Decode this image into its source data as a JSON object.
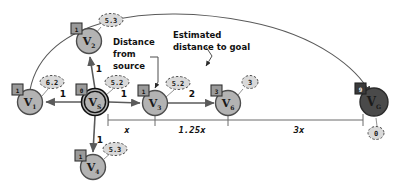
{
  "diagram": {
    "colors": {
      "node_fill": "#b3b3b3",
      "node_stroke": "#4d4d4d",
      "goal_fill": "#4a4a4a",
      "goal_stroke": "#2b2b2b",
      "badge_fill": "#9a9a9a",
      "badge_stroke": "#333333",
      "goal_badge_fill": "#3a3a3a",
      "heur_fill": "#d9d9d9",
      "heur_stroke": "#4d4d4d",
      "edge": "#5a5a5a",
      "text": "#111111"
    },
    "nodes": [
      {
        "id": "v1",
        "label": "V",
        "sub": "1",
        "cx": 30,
        "cy": 102,
        "r": 12.5,
        "kind": "normal",
        "badge": "1",
        "badge_dx": -14,
        "badge_dy": -12,
        "heuristic": "6.2",
        "heur_dx": 22,
        "heur_dy": -20
      },
      {
        "id": "v2",
        "label": "V",
        "sub": "2",
        "cx": 89,
        "cy": 41,
        "r": 12.5,
        "kind": "normal",
        "badge": "1",
        "badge_dx": -14,
        "badge_dy": -12,
        "heuristic": "5.3",
        "heur_dx": 22,
        "heur_dy": -21
      },
      {
        "id": "vs",
        "label": "V",
        "sub": "S",
        "cx": 95,
        "cy": 102,
        "r": 13.5,
        "kind": "source",
        "badge": "0",
        "badge_dx": -15,
        "badge_dy": -13,
        "heuristic": "5.2",
        "heur_dx": 22,
        "heur_dy": -20
      },
      {
        "id": "v3",
        "label": "V",
        "sub": "3",
        "cx": 155,
        "cy": 103,
        "r": 12.5,
        "kind": "normal",
        "badge": "1",
        "badge_dx": -13,
        "badge_dy": -12,
        "heuristic": "5.2",
        "heur_dx": 23,
        "heur_dy": -20
      },
      {
        "id": "v4",
        "label": "V",
        "sub": "4",
        "cx": 93,
        "cy": 167,
        "r": 12.5,
        "kind": "normal",
        "badge": "1",
        "badge_dx": -14,
        "badge_dy": -11,
        "heuristic": "5.3",
        "heur_dx": 22,
        "heur_dy": -18
      },
      {
        "id": "v6",
        "label": "V",
        "sub": "6",
        "cx": 228,
        "cy": 103,
        "r": 12.5,
        "kind": "normal",
        "badge": "3",
        "badge_dx": -13,
        "badge_dy": -12,
        "heuristic": "3",
        "heur_dx": 22,
        "heur_dy": -21
      },
      {
        "id": "vg",
        "label": "V",
        "sub": "G",
        "cx": 374,
        "cy": 102,
        "r": 14,
        "kind": "goal",
        "badge": "9",
        "badge_dx": -15,
        "badge_dy": -13,
        "heuristic": "0",
        "heur_dx": 2,
        "heur_dy": 31
      }
    ],
    "edges": [
      {
        "id": "vs-v1",
        "from": "vs",
        "to": "v1",
        "weight": "1",
        "wx": 63,
        "wy": 97
      },
      {
        "id": "vs-v2",
        "from": "vs",
        "to": "v2",
        "weight": "1",
        "wx": 99,
        "wy": 72
      },
      {
        "id": "vs-v3",
        "from": "vs",
        "to": "v3",
        "weight": "1",
        "wx": 124,
        "wy": 97
      },
      {
        "id": "vs-v4",
        "from": "vs",
        "to": "v4",
        "weight": "1",
        "wx": 100,
        "wy": 143
      },
      {
        "id": "v3-v6",
        "from": "v3",
        "to": "v6",
        "weight": "2",
        "wx": 192,
        "wy": 97
      },
      {
        "id": "v1-vg",
        "from": "v1",
        "to": "vg",
        "weight": "",
        "wx": 0,
        "wy": 0,
        "curved": true
      }
    ],
    "measures": [
      {
        "id": "x",
        "label": "x",
        "x1": 108,
        "x2": 147,
        "y": 120,
        "tx": 127,
        "ty": 133
      },
      {
        "id": "1.25x",
        "label": "1.25x",
        "x1": 163,
        "x2": 221,
        "y": 120,
        "tx": 192,
        "ty": 133
      },
      {
        "id": "3x",
        "label": "3x",
        "x1": 236,
        "x2": 363,
        "y": 120,
        "tx": 299,
        "ty": 133
      }
    ],
    "callouts": [
      {
        "id": "distance-from-source",
        "lines": [
          "Distance",
          "from",
          "source"
        ],
        "x": 113,
        "y": 45,
        "line_h": 12
      },
      {
        "id": "estimated-distance-to-goal",
        "lines": [
          "Estimated",
          "distance to goal"
        ],
        "x": 173,
        "y": 38,
        "line_h": 12
      }
    ]
  }
}
